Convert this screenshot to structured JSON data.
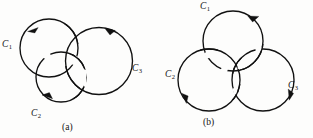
{
  "figure": {
    "kind": "knot-link-diagram",
    "background_color": "#fdfdfc",
    "stroke_color": "#111111",
    "panels": [
      {
        "id": "a",
        "caption": "(a)",
        "description": "Three oriented circles forming a link, with C1 upper left, C2 lower left, C3 right",
        "labels": [
          {
            "name": "C",
            "sub": "1",
            "text": "C1"
          },
          {
            "name": "C",
            "sub": "2",
            "text": "C2"
          },
          {
            "name": "C",
            "sub": "3",
            "text": "C3"
          }
        ]
      },
      {
        "id": "b",
        "caption": "(b)",
        "description": "Three oriented circles in Borromean arrangement, C1 top, C2 lower left, C3 lower right",
        "labels": [
          {
            "name": "C",
            "sub": "1",
            "text": "C1"
          },
          {
            "name": "C",
            "sub": "2",
            "text": "C2"
          },
          {
            "name": "C",
            "sub": "3",
            "text": "C3"
          }
        ]
      }
    ]
  },
  "panel_a": {
    "label_c1": "C",
    "label_c1_sub": "1",
    "label_c2": "C",
    "label_c2_sub": "2",
    "label_c3": "C",
    "label_c3_sub": "3",
    "caption": "(a)"
  },
  "panel_b": {
    "label_c1": "C",
    "label_c1_sub": "1",
    "label_c2": "C",
    "label_c2_sub": "2",
    "label_c3": "C",
    "label_c3_sub": "3",
    "caption": "(b)"
  }
}
